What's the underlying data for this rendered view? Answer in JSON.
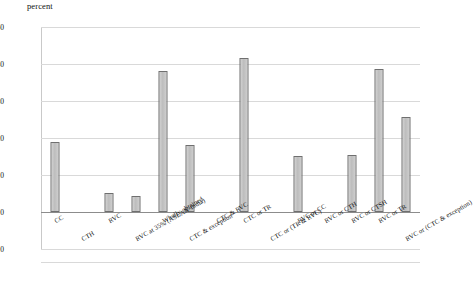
{
  "chart_data": {
    "type": "bar",
    "title": "percent",
    "xlabel": "",
    "ylabel": "percent",
    "ylim": [
      -10,
      50
    ],
    "yticks": [
      -10,
      0,
      10,
      20,
      30,
      40,
      50
    ],
    "grid": true,
    "legend": "none",
    "categories": [
      "CC",
      "CTH",
      "RVC",
      "RVC at 35% (ASEAN-India)",
      "Wholly obtained",
      "CTC & exception",
      "CTC & RVC",
      "CTC or TR",
      "CTC or (TR & RVC)",
      "RVC or CC",
      "RVC or CTH",
      "RVC or CTSH",
      "RVC or TR",
      "RVC or (CTC & exception)"
    ],
    "values": [
      19.0,
      0,
      5.2,
      4.4,
      38.2,
      18.0,
      0,
      41.5,
      0,
      15.2,
      0,
      15.4,
      38.7,
      25.7
    ],
    "rows": [
      {
        "label": "CC",
        "value": 19.0,
        "row": 1
      },
      {
        "label": "CTH",
        "value": 0,
        "row": 2
      },
      {
        "label": "RVC",
        "value": 5.2,
        "row": 1
      },
      {
        "label": "RVC at 35% (ASEAN-India)",
        "value": 4.4,
        "row": 2
      },
      {
        "label": "Wholly obtained",
        "value": 38.2,
        "row": 1
      },
      {
        "label": "CTC & exception",
        "value": 18.0,
        "row": 2
      },
      {
        "label": "CTC & RVC",
        "value": 0,
        "row": 1
      },
      {
        "label": "CTC or TR",
        "value": 41.5,
        "row": 1
      },
      {
        "label": "CTC or (TR & RVC)",
        "value": 0,
        "row": 2
      },
      {
        "label": "RVC or CC",
        "value": 15.2,
        "row": 1
      },
      {
        "label": "RVC or CTH",
        "value": 0,
        "row": 1
      },
      {
        "label": "RVC or CTSH",
        "value": 15.4,
        "row": 1
      },
      {
        "label": "RVC or TR",
        "value": 38.7,
        "row": 1
      },
      {
        "label": "RVC or (CTC & exception)",
        "value": 25.7,
        "row": 2
      }
    ]
  },
  "axis": {
    "title": "percent",
    "tick_50": "50",
    "tick_40": "40",
    "tick_30": "30",
    "tick_20": "20",
    "tick_10": "10",
    "tick_0": "0",
    "tick_neg10": "-10"
  },
  "colors": {
    "bar_fill": "#c8c8c8",
    "bar_border": "#6f6f6f",
    "gridline": "#d9d9d9",
    "text": "#111111",
    "background": "#ffffff"
  }
}
